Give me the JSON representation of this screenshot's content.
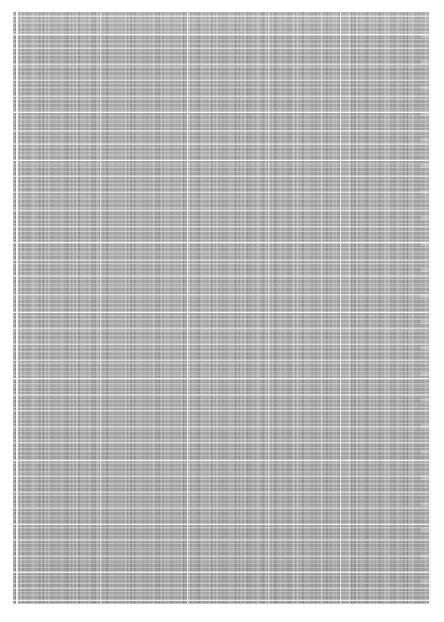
{
  "document": {
    "kind": "scanned-page",
    "page_background": "#ffffff",
    "content_background": "#a2a2a2",
    "rule_color": "#ffffff",
    "legible_text": false,
    "note_not_rendered": "No text is legible at this resolution; the page body renders as a gray type texture."
  },
  "page": {
    "width": 444,
    "height": 622,
    "margins": {
      "left": 13,
      "top": 12,
      "right": 13,
      "bottom": 18
    }
  },
  "content_block": {
    "left": 13,
    "top": 12,
    "width": 418,
    "height": 592,
    "type": "dense-table"
  },
  "table": {
    "row_pitch": 4.0,
    "column_rules_x": [
      3,
      87,
      174,
      255,
      327,
      416
    ],
    "section_rules_y": [
      4,
      22,
      36,
      52,
      68,
      84,
      100,
      118,
      132,
      148,
      164,
      180,
      198,
      214,
      230,
      248,
      264,
      282,
      300,
      316,
      332,
      348,
      366,
      382,
      398,
      414,
      430,
      448,
      464,
      480,
      496,
      512,
      528,
      544,
      560,
      576,
      588
    ],
    "strong_section_rules_y": [
      22,
      100,
      148,
      230,
      300,
      366,
      448,
      512,
      560,
      588
    ]
  }
}
